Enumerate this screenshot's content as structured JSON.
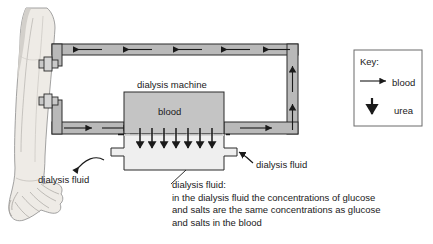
{
  "diagram": {
    "title_labels": {
      "dialysis_machine": "dialysis machine",
      "blood": "blood",
      "dialysis_fluid_left": "dialysis fluid",
      "dialysis_fluid_right": "dialysis fluid"
    },
    "caption": {
      "heading": "dialysis fluid:",
      "lines": [
        "in the dialysis fluid the concentrations of glucose",
        "and salts are the same concentrations as glucose",
        "and salts in the blood"
      ]
    },
    "key": {
      "title": "Key:",
      "entries": [
        {
          "symbol": "arrow-right",
          "label": "blood"
        },
        {
          "symbol": "arrow-down",
          "label": "urea"
        }
      ]
    },
    "counts": {
      "top_tube_arrows": 5,
      "bottom_tube_left_arrows": 2,
      "bottom_tube_right_arrows": 1,
      "right_tube_arrows": 2,
      "urea_arrows": 7,
      "arm_clamps": 2
    },
    "colors": {
      "tube_fill": "#b9b9b9",
      "blood_fill": "#c4c4c4",
      "fluid_fill": "#eeeeee",
      "arm_fill": "#e6e3de",
      "outline": "#1a1a1a",
      "text": "#1a1a1a",
      "key_border": "#6b6b6b"
    }
  }
}
